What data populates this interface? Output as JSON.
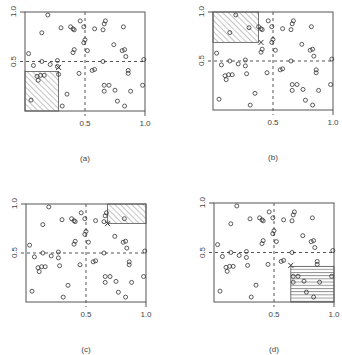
{
  "figure": {
    "panels": [
      {
        "id": "a",
        "caption": "(a)",
        "box": {
          "x": 25,
          "y": 12,
          "w": 120,
          "h": 99
        },
        "region": {
          "x0": 0.0,
          "x1": 0.28,
          "y0": 0.0,
          "y1": 0.4,
          "fill": "diagonal"
        },
        "marker": {
          "x": 0.28,
          "y": 0.44
        }
      },
      {
        "id": "b",
        "caption": "(b)",
        "box": {
          "x": 213,
          "y": 12,
          "w": 120,
          "h": 98
        },
        "region": {
          "x0": 0.0,
          "x1": 0.38,
          "y0": 0.69,
          "y1": 1.0,
          "fill": "diagonal"
        },
        "marker": {
          "x": 0.4,
          "y": 0.69
        }
      },
      {
        "id": "c",
        "caption": "(c)",
        "box": {
          "x": 26,
          "y": 204,
          "w": 120,
          "h": 98
        },
        "region": {
          "x0": 0.68,
          "x1": 1.0,
          "y0": 0.8,
          "y1": 1.0,
          "fill": "diagonal"
        },
        "marker": {
          "x": 0.68,
          "y": 0.8
        }
      },
      {
        "id": "d",
        "caption": "(d)",
        "box": {
          "x": 214,
          "y": 203,
          "w": 120,
          "h": 99
        },
        "region": {
          "x0": 0.64,
          "x1": 1.0,
          "y0": 0.0,
          "y1": 0.36,
          "fill": "horizontal"
        },
        "marker": {
          "x": 0.64,
          "y": 0.37
        }
      }
    ],
    "x_ticks": [
      "0.5",
      "1.0"
    ],
    "y_ticks": [
      "0.5",
      "1.0"
    ]
  },
  "chart_data": {
    "type": "scatter",
    "title": "",
    "xlabel": "",
    "ylabel": "",
    "xlim": [
      0,
      1
    ],
    "ylim": [
      0,
      1
    ],
    "reference_lines": {
      "x": 0.5,
      "y": 0.5,
      "style": "dashed"
    },
    "panels": [
      "(a)",
      "(b)",
      "(c)",
      "(d)"
    ],
    "points": [
      [
        0.19,
        0.97
      ],
      [
        0.14,
        0.79
      ],
      [
        0.3,
        0.84
      ],
      [
        0.38,
        0.85
      ],
      [
        0.4,
        0.83
      ],
      [
        0.41,
        0.82
      ],
      [
        0.46,
        0.91
      ],
      [
        0.49,
        0.85
      ],
      [
        0.58,
        0.83
      ],
      [
        0.65,
        0.82
      ],
      [
        0.66,
        0.88
      ],
      [
        0.67,
        0.91
      ],
      [
        0.82,
        0.85
      ],
      [
        0.03,
        0.58
      ],
      [
        0.5,
        0.72
      ],
      [
        0.49,
        0.69
      ],
      [
        0.52,
        0.61
      ],
      [
        0.41,
        0.62
      ],
      [
        0.4,
        0.59
      ],
      [
        0.74,
        0.67
      ],
      [
        0.81,
        0.61
      ],
      [
        0.83,
        0.62
      ],
      [
        0.84,
        0.55
      ],
      [
        0.14,
        0.5
      ],
      [
        0.07,
        0.46
      ],
      [
        0.21,
        0.47
      ],
      [
        0.27,
        0.51
      ],
      [
        0.27,
        0.45
      ],
      [
        0.65,
        0.5
      ],
      [
        0.99,
        0.52
      ],
      [
        0.1,
        0.35
      ],
      [
        0.11,
        0.31
      ],
      [
        0.13,
        0.36
      ],
      [
        0.16,
        0.36
      ],
      [
        0.28,
        0.37
      ],
      [
        0.45,
        0.38
      ],
      [
        0.58,
        0.42
      ],
      [
        0.56,
        0.41
      ],
      [
        0.86,
        0.41
      ],
      [
        0.86,
        0.38
      ],
      [
        0.66,
        0.26
      ],
      [
        0.7,
        0.26
      ],
      [
        0.66,
        0.2
      ],
      [
        0.75,
        0.21
      ],
      [
        0.88,
        0.2
      ],
      [
        0.98,
        0.26
      ],
      [
        0.35,
        0.17
      ],
      [
        0.77,
        0.1
      ],
      [
        0.05,
        0.11
      ],
      [
        0.31,
        0.05
      ],
      [
        0.83,
        0.05
      ]
    ]
  }
}
